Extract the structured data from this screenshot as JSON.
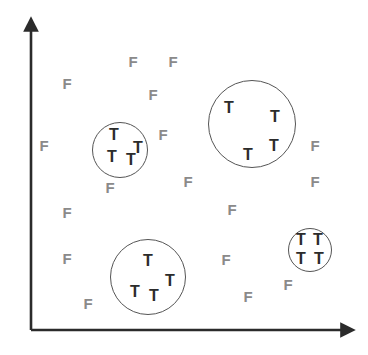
{
  "figure": {
    "name": "cluster-scatter-diagram",
    "width": 368,
    "height": 355,
    "background_color": "#ffffff"
  },
  "axes": {
    "color": "#2b2b2b",
    "origin": {
      "x": 31,
      "y": 330
    },
    "y_axis": {
      "label": "",
      "tip_x": 31,
      "tip_y": 18,
      "arrow": "up-arrow"
    },
    "x_axis": {
      "label": "",
      "tip_x": 355,
      "tip_y": 330,
      "arrow": "right-arrow"
    }
  },
  "legend": {
    "positive_symbol": "T",
    "negative_symbol": "F",
    "positive_color": "#2b2b2b",
    "negative_color": "#8a8a8a",
    "cluster_outline_color": "#555555"
  },
  "chart_data": {
    "type": "scatter",
    "title": "",
    "xlabel": "",
    "ylabel": "",
    "xlim": [
      0,
      368
    ],
    "ylim": [
      0,
      355
    ],
    "grid": false,
    "legend_position": "none",
    "series": [
      {
        "name": "T",
        "label": "T",
        "color": "#2b2b2b",
        "count": 16,
        "points": [
          {
            "x": 114,
            "y": 135,
            "label": "T"
          },
          {
            "x": 138,
            "y": 148,
            "label": "T"
          },
          {
            "x": 112,
            "y": 157,
            "label": "T"
          },
          {
            "x": 131,
            "y": 160,
            "label": "T"
          },
          {
            "x": 229,
            "y": 108,
            "label": "T"
          },
          {
            "x": 275,
            "y": 117,
            "label": "T"
          },
          {
            "x": 274,
            "y": 146,
            "label": "T"
          },
          {
            "x": 248,
            "y": 155,
            "label": "T"
          },
          {
            "x": 148,
            "y": 261,
            "label": "T"
          },
          {
            "x": 170,
            "y": 281,
            "label": "T"
          },
          {
            "x": 135,
            "y": 292,
            "label": "T"
          },
          {
            "x": 154,
            "y": 296,
            "label": "T"
          },
          {
            "x": 301,
            "y": 240,
            "label": "T"
          },
          {
            "x": 318,
            "y": 240,
            "label": "T"
          },
          {
            "x": 301,
            "y": 259,
            "label": "T"
          },
          {
            "x": 319,
            "y": 259,
            "label": "T"
          }
        ]
      },
      {
        "name": "F",
        "label": "F",
        "color": "#8a8a8a",
        "count": 16,
        "points": [
          {
            "x": 133,
            "y": 61,
            "label": "F"
          },
          {
            "x": 173,
            "y": 61,
            "label": "F"
          },
          {
            "x": 67,
            "y": 83,
            "label": "F"
          },
          {
            "x": 153,
            "y": 94,
            "label": "F"
          },
          {
            "x": 44,
            "y": 145,
            "label": "F"
          },
          {
            "x": 163,
            "y": 134,
            "label": "F"
          },
          {
            "x": 315,
            "y": 145,
            "label": "F"
          },
          {
            "x": 110,
            "y": 187,
            "label": "F"
          },
          {
            "x": 188,
            "y": 181,
            "label": "F"
          },
          {
            "x": 315,
            "y": 181,
            "label": "F"
          },
          {
            "x": 67,
            "y": 212,
            "label": "F"
          },
          {
            "x": 232,
            "y": 209,
            "label": "F"
          },
          {
            "x": 67,
            "y": 258,
            "label": "F"
          },
          {
            "x": 226,
            "y": 259,
            "label": "F"
          },
          {
            "x": 288,
            "y": 284,
            "label": "F"
          },
          {
            "x": 248,
            "y": 296,
            "label": "F"
          },
          {
            "x": 88,
            "y": 303,
            "label": "F"
          }
        ]
      }
    ],
    "clusters": [
      {
        "name": "cluster-left",
        "cx": 120,
        "cy": 150,
        "r": 28,
        "members": 4,
        "member_label": "T"
      },
      {
        "name": "cluster-top-right",
        "cx": 252,
        "cy": 124,
        "r": 44,
        "members": 4,
        "member_label": "T"
      },
      {
        "name": "cluster-bottom-left",
        "cx": 148,
        "cy": 277,
        "r": 38,
        "members": 4,
        "member_label": "T"
      },
      {
        "name": "cluster-bottom-right",
        "cx": 310,
        "cy": 250,
        "r": 22,
        "members": 4,
        "member_label": "T"
      }
    ]
  }
}
